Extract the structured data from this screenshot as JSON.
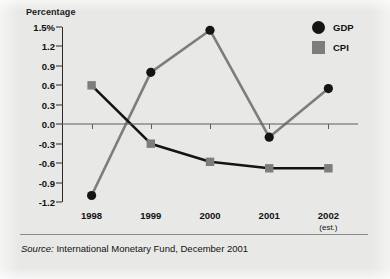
{
  "chart_data": {
    "type": "line",
    "title": "",
    "ylabel": "Percentage",
    "xlabel": "",
    "categories": [
      "1998",
      "1999",
      "2000",
      "2001",
      "2002"
    ],
    "x_sublabels": [
      "",
      "",
      "",
      "",
      "(est.)"
    ],
    "ylim": [
      -1.2,
      1.5
    ],
    "yticks": [
      "1.5%",
      "1.2",
      "0.9",
      "0.6",
      "0.3",
      "0.0",
      "-0.3",
      "-0.6",
      "-0.9",
      "-1.2"
    ],
    "ytick_values": [
      1.5,
      1.2,
      0.9,
      0.6,
      0.3,
      0.0,
      -0.3,
      -0.6,
      -0.9,
      -1.2
    ],
    "grid": false,
    "legend_position": "top-right",
    "zero_line": 0.0,
    "series": [
      {
        "name": "GDP",
        "values": [
          -1.1,
          0.8,
          1.45,
          -0.2,
          0.55
        ],
        "line_color": "#7d7d7d",
        "marker": "circle",
        "marker_color": "#141414"
      },
      {
        "name": "CPI",
        "values": [
          0.6,
          -0.3,
          -0.58,
          -0.68,
          -0.68
        ],
        "line_color": "#141414",
        "marker": "square",
        "marker_color": "#7d7d7d"
      }
    ]
  },
  "legend": {
    "items": [
      {
        "label": "GDP",
        "marker": "circle",
        "color": "#141414"
      },
      {
        "label": "CPI",
        "marker": "square",
        "color": "#7d7d7d"
      }
    ]
  },
  "source": {
    "keyword": "Source:",
    "text": "International Monetary Fund, December 2001"
  },
  "colors": {
    "background": "#e8e8e6",
    "gdp": "#141414",
    "cpi": "#7d7d7d",
    "axis": "#2a2a2a",
    "zero_line": "#5d5d5d"
  }
}
